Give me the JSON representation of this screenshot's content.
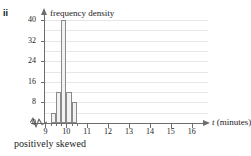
{
  "part_label": "ii",
  "caption": "positively skewed",
  "chart_data": {
    "type": "bar",
    "title": "",
    "ylabel": "frequency density",
    "xlabel": "t (minutes)",
    "xlabel_variable": "t",
    "xlabel_unit": "(minutes)",
    "grid": true,
    "legend": "none",
    "xlim": [
      8.6,
      16.4
    ],
    "ylim": [
      0,
      42
    ],
    "x_axis_break": true,
    "xticks": [
      9,
      10,
      11,
      12,
      13,
      14,
      15,
      16
    ],
    "xtick_labels": [
      "9",
      "10",
      "11",
      "12",
      "13",
      "14",
      "15",
      "16"
    ],
    "x_minor_ticks": [
      9.25,
      9.5,
      9.75,
      10.25,
      10.5
    ],
    "yticks": [
      0,
      8,
      16,
      24,
      32,
      40
    ],
    "ytick_labels": [
      "0",
      "8",
      "16",
      "24",
      "32",
      "40"
    ],
    "gridlines": [
      4,
      8,
      12,
      16,
      20,
      24,
      28,
      32,
      36,
      40
    ],
    "bin_width": 0.25,
    "bins": [
      {
        "start": 9.25,
        "end": 9.5,
        "value": 4
      },
      {
        "start": 9.5,
        "end": 9.75,
        "value": 12
      },
      {
        "start": 9.75,
        "end": 10.0,
        "value": 40
      },
      {
        "start": 10.0,
        "end": 10.25,
        "value": 12
      },
      {
        "start": 10.25,
        "end": 10.5,
        "value": 8
      }
    ],
    "categories": [
      "9.25-9.5",
      "9.5-9.75",
      "9.75-10.0",
      "10.0-10.25",
      "10.25-10.5"
    ],
    "values": [
      4,
      12,
      40,
      12,
      8
    ],
    "bar_fill": "#f2f2f2",
    "bar_stroke": "#8a8a8a",
    "axis_color": "#6d6d6d",
    "grid_color": "#e6e6e6"
  }
}
